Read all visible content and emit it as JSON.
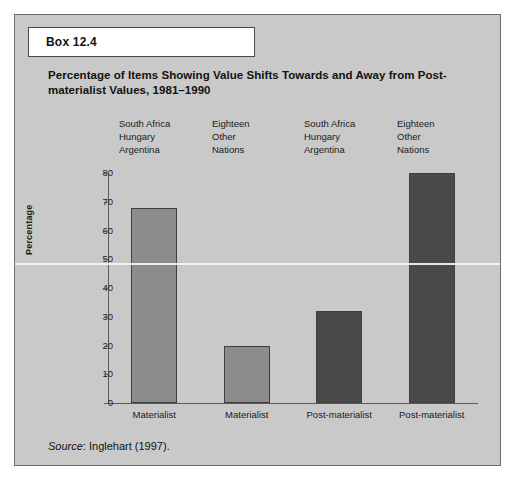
{
  "box": {
    "label": "Box 12.4"
  },
  "title": "Percentage of Items Showing Value Shifts Towards and Away from Post-materialist Values, 1981–1990",
  "source": {
    "word": "Source",
    "rest": ": Inglehart (1997)."
  },
  "colors": {
    "panel_background": "#c9c9c9",
    "bar_light": "#8c8c8c",
    "bar_dark": "#4a4a4a",
    "bar_outline": "#3f3f3f",
    "axis": "#5a5a5a",
    "text": "#1a1a1a"
  },
  "chart_data": {
    "type": "bar",
    "title": "Percentage of Items Showing Value Shifts Towards and Away from Post-materialist Values, 1981–1990",
    "xlabel": "",
    "ylabel": "Percentage",
    "ylim": [
      0,
      80
    ],
    "yticks": [
      0,
      10,
      20,
      30,
      40,
      50,
      60,
      70,
      80
    ],
    "ytick_labels": [
      "0",
      "10",
      "20",
      "30",
      "40",
      "50",
      "60",
      "70",
      "80"
    ],
    "grid": false,
    "legend": "none",
    "categories": [
      "Materialist",
      "Materialist",
      "Post-materialist",
      "Post-materialist"
    ],
    "group_labels": [
      "South Africa\nHungary\nArgentina",
      "Eighteen\nOther\nNations",
      "South Africa\nHungary\nArgentina",
      "Eighteen\nOther\nNations"
    ],
    "group_labels_lines": [
      [
        "South Africa",
        "Hungary",
        "Argentina"
      ],
      [
        "Eighteen",
        "Other",
        "Nations"
      ],
      [
        "South Africa",
        "Hungary",
        "Argentina"
      ],
      [
        "Eighteen",
        "Other",
        "Nations"
      ]
    ],
    "values": [
      68,
      20,
      32,
      80
    ],
    "bar_colors": [
      "#8c8c8c",
      "#8c8c8c",
      "#4a4a4a",
      "#4a4a4a"
    ]
  }
}
